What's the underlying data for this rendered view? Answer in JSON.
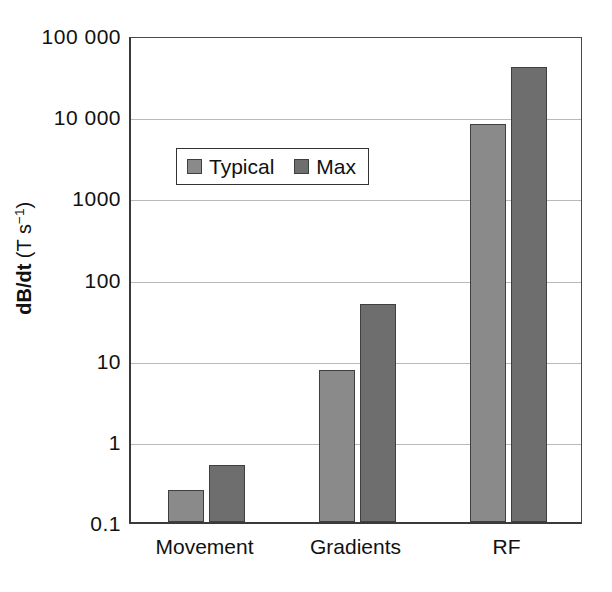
{
  "chart_data": {
    "type": "bar",
    "title": "",
    "subtitle": "",
    "xlabel": "",
    "ylabel": "dB/dt (T s⁻¹)",
    "ylabel_bold_part": "dB/dt",
    "ylabel_unit_part": " (T s",
    "ylabel_unit_exp": "−1",
    "ylabel_unit_close": ")",
    "yscale": "log",
    "ylim": [
      0.1,
      100000
    ],
    "ytick_labels": [
      "100 000",
      "10 000",
      "1000",
      "100",
      "10",
      "1",
      "0.1"
    ],
    "ytick_values": [
      100000,
      10000,
      1000,
      100,
      10,
      1,
      0.1
    ],
    "grid": true,
    "grid_axis": "y",
    "legend_position": "upper-left-inside",
    "categories": [
      "Movement",
      "Gradients",
      "RF"
    ],
    "series": [
      {
        "name": "Typical",
        "color": "#8a8a8a",
        "values": [
          0.25,
          7.5,
          8000
        ]
      },
      {
        "name": "Max",
        "color": "#6e6e6e",
        "values": [
          0.5,
          48,
          40000
        ]
      }
    ]
  },
  "legend": {
    "entries": [
      {
        "label": "Typical",
        "swatch": "legend-swatch-typical"
      },
      {
        "label": "Max",
        "swatch": "legend-swatch-max"
      }
    ]
  },
  "axes": {
    "y_title": "dB/dt (T s⁻¹)",
    "x_categories": [
      "Movement",
      "Gradients",
      "RF"
    ],
    "y_ticks": [
      "100 000",
      "10 000",
      "1000",
      "100",
      "10",
      "1",
      "0.1"
    ]
  }
}
